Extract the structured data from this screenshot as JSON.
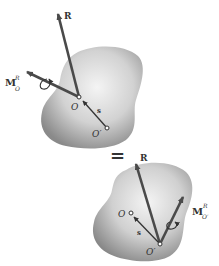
{
  "figure": {
    "equals_sign": "=",
    "top": {
      "resultant_label": "R",
      "moment_label": {
        "main": "M",
        "sup": "R",
        "sub": "O"
      },
      "point_O_label": "O",
      "point_O_prime_label": "O′",
      "position_vector_label": "s"
    },
    "bottom": {
      "resultant_label": "R",
      "moment_label": {
        "main": "M",
        "sup": "R",
        "sub": "O′"
      },
      "point_O_label": "O",
      "point_O_prime_label": "O′",
      "position_vector_label": "s"
    }
  },
  "colors": {
    "vector": "#4a4a4a",
    "body_light": "#f2f2f2",
    "body_dark": "#8e8e8e",
    "label": "#333333"
  }
}
